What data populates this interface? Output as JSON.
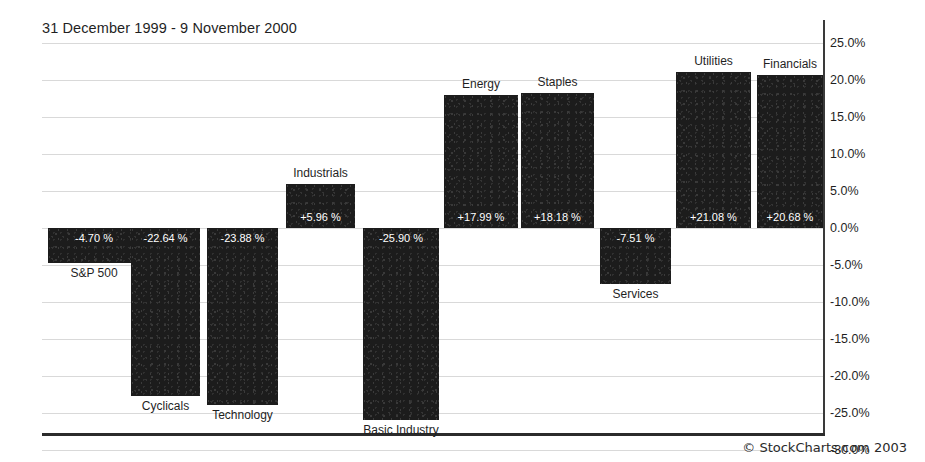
{
  "chart_data": {
    "type": "bar",
    "title": "31 December 1999 - 9 November 2000",
    "xlabel": "",
    "ylabel": "",
    "grid": true,
    "legend": "none",
    "ylim": [
      -30.0,
      25.0
    ],
    "ytick_labels": [
      "25.0%",
      "20.0%",
      "15.0%",
      "10.0%",
      "5.0%",
      "0.0%",
      "-5.0%",
      "-10.0%",
      "-15.0%",
      "-20.0%",
      "-25.0%",
      "-30.0%"
    ],
    "ytick_values": [
      25.0,
      20.0,
      15.0,
      10.0,
      5.0,
      0.0,
      -5.0,
      -10.0,
      -15.0,
      -20.0,
      -25.0,
      -30.0
    ],
    "categories": [
      "S&P 500",
      "Cyclicals",
      "Technology",
      "Industrials",
      "Basic Industry",
      "Energy",
      "Staples",
      "Services",
      "Utilities",
      "Financials"
    ],
    "values": [
      -4.7,
      -22.64,
      -23.88,
      5.96,
      -25.9,
      17.99,
      18.18,
      -7.51,
      21.08,
      20.68
    ],
    "value_labels": [
      "-4.70 %",
      "-22.64 %",
      "-23.88 %",
      "+5.96 %",
      "-25.90 %",
      "+17.99 %",
      "+18.18 %",
      "-7.51 %",
      "+21.08 %",
      "+20.68 %"
    ],
    "bar_color": "#1c1c1c",
    "grid_color": "#d9d9d9",
    "axis_color": "#2b2b2b",
    "value_label_color": "#ffffff"
  },
  "bars": [
    {
      "label": "S&P 500",
      "value_label": "-4.70 %",
      "left": 48,
      "width": 92
    },
    {
      "label": "Cyclicals",
      "value_label": "-22.64 %",
      "left": 131,
      "width": 69
    },
    {
      "label": "Technology",
      "value_label": "-23.88 %",
      "left": 207,
      "width": 71
    },
    {
      "label": "Industrials",
      "value_label": "+5.96 %",
      "left": 286,
      "width": 69
    },
    {
      "label": "Basic Industry",
      "value_label": "-25.90 %",
      "left": 363,
      "width": 76
    },
    {
      "label": "Energy",
      "value_label": "+17.99 %",
      "left": 444,
      "width": 74
    },
    {
      "label": "Staples",
      "value_label": "+18.18 %",
      "left": 521,
      "width": 73
    },
    {
      "label": "Services",
      "value_label": "-7.51 %",
      "left": 600,
      "width": 71
    },
    {
      "label": "Utilities",
      "value_label": "+21.08 %",
      "left": 676,
      "width": 75
    },
    {
      "label": "Financials",
      "value_label": "+20.68 %",
      "left": 757,
      "width": 66
    }
  ],
  "footer": {
    "copyright": "© StockCharts.com 2003"
  }
}
